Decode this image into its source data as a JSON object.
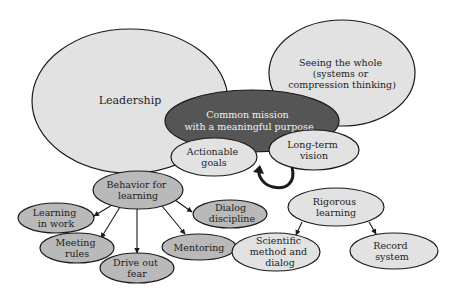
{
  "diagram": {
    "colors": {
      "light_fill": "#e2e2e2",
      "medium_fill": "#b9b9b9",
      "dark_fill": "#555555",
      "stroke": "#1a1a1a",
      "text_dark": "#222222",
      "text_light": "#f2f2f2"
    },
    "nodes": {
      "leadership": {
        "lines": [
          "Leadership"
        ]
      },
      "seeing_whole": {
        "lines": [
          "Seeing the whole",
          "(systems or",
          "compression thinking)"
        ]
      },
      "common_mission": {
        "lines": [
          "Common mission",
          "with a meaningful purpose"
        ]
      },
      "actionable_goals": {
        "lines": [
          "Actionable",
          "goals"
        ]
      },
      "long_term_vision": {
        "lines": [
          "Long-term",
          "vision"
        ]
      },
      "behavior_for_learning": {
        "lines": [
          "Behavior for",
          "learning"
        ]
      },
      "learning_in_work": {
        "lines": [
          "Learning",
          "in work"
        ]
      },
      "meeting_rules": {
        "lines": [
          "Meeting",
          "rules"
        ]
      },
      "drive_out_fear": {
        "lines": [
          "Drive out",
          "fear"
        ]
      },
      "mentoring": {
        "lines": [
          "Mentoring"
        ]
      },
      "dialog_discipline": {
        "lines": [
          "Dialog",
          "discipline"
        ]
      },
      "rigorous_learning": {
        "lines": [
          "Rigorous",
          "learning"
        ]
      },
      "scientific_method": {
        "lines": [
          "Scientific",
          "method and",
          "dialog"
        ]
      },
      "record_system": {
        "lines": [
          "Record",
          "system"
        ]
      }
    },
    "edges": [
      {
        "from": "behavior_for_learning",
        "to": "learning_in_work"
      },
      {
        "from": "behavior_for_learning",
        "to": "meeting_rules"
      },
      {
        "from": "behavior_for_learning",
        "to": "drive_out_fear"
      },
      {
        "from": "behavior_for_learning",
        "to": "mentoring"
      },
      {
        "from": "behavior_for_learning",
        "to": "dialog_discipline"
      },
      {
        "from": "rigorous_learning",
        "to": "scientific_method"
      },
      {
        "from": "rigorous_learning",
        "to": "record_system"
      },
      {
        "from": "long_term_vision",
        "to": "actionable_goals",
        "style": "curved-loop"
      }
    ]
  }
}
